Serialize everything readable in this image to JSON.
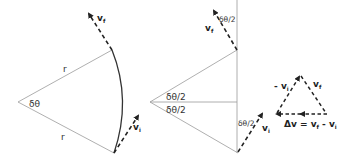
{
  "diagram": {
    "colors": {
      "line": "#9a9a9a",
      "arc": "#333333",
      "vector": "#222222",
      "text": "#333333"
    },
    "left_sector": {
      "radius_label_top": "r",
      "radius_label_bottom": "r",
      "angle_label": "δθ",
      "final_velocity": {
        "symbol": "v",
        "subscript": "f"
      },
      "initial_velocity": {
        "symbol": "v",
        "subscript": "i"
      }
    },
    "middle_geometry": {
      "half_angle_upper": "δθ/2",
      "half_angle_lower": "δθ/2",
      "half_angle_top_vector": "δθ/2",
      "half_angle_bottom_vector": "δθ/2",
      "final_velocity": {
        "symbol": "v",
        "subscript": "f"
      },
      "initial_velocity": {
        "symbol": "v",
        "subscript": "i"
      }
    },
    "vector_triangle": {
      "neg_vi": {
        "prefix": "- ",
        "symbol": "v",
        "subscript": "i"
      },
      "vf": {
        "symbol": "v",
        "subscript": "f"
      },
      "delta_v": {
        "lhs": "Δv = ",
        "a": "v",
        "a_sub": "f",
        "mid": " - ",
        "b": "v",
        "b_sub": "i"
      }
    }
  }
}
